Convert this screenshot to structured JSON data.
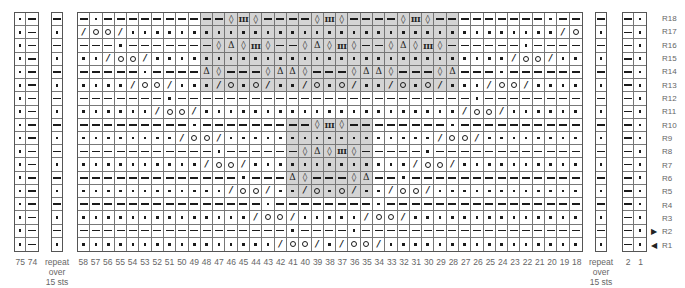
{
  "legend_symbols": {
    "-": "purl",
    ".": "knit",
    "/": "k2tog",
    "o": "yarn-over",
    "d": "diamond",
    "t": "triangle",
    "3": "triple-bar"
  },
  "symbol_glyphs": {
    "/": "/",
    "d": "◊",
    "t": "Δ",
    "3": "III"
  },
  "left_panel": {
    "columns": [
      "75",
      "74"
    ],
    "rows_pattern": [
      ".-"
    ]
  },
  "left_repeat": {
    "label_lines": [
      "repeat",
      "over",
      "15 sts"
    ]
  },
  "right_repeat": {
    "label_lines": [
      "repeat",
      "over",
      "15 sts"
    ]
  },
  "right_panel": {
    "columns": [
      "2",
      "1"
    ],
    "rows_pattern": [
      "-."
    ]
  },
  "main_chart": {
    "columns": [
      "58",
      "57",
      "56",
      "55",
      "54",
      "53",
      "52",
      "51",
      "50",
      "49",
      "48",
      "47",
      "46",
      "45",
      "44",
      "43",
      "42",
      "41",
      "40",
      "39",
      "38",
      "37",
      "36",
      "35",
      "34",
      "33",
      "32",
      "31",
      "30",
      "29",
      "28",
      "27",
      "26",
      "25",
      "24",
      "23",
      "22",
      "21",
      "20",
      "19",
      "18"
    ],
    "rows": [
      {
        "label": "R18",
        "cells": "-.----------d3d----d3d----d3d---------.--",
        "repeat": "-"
      },
      {
        "label": "R17",
        "cells": "/oo/.................................../oo/",
        "repeat": "."
      },
      {
        "label": "R16",
        "cells": "---.-------dtd3d--dtd3d--dtd3d------.----",
        "repeat": "-"
      },
      {
        "label": "R15",
        "cells": "../oo/............................./oo/..",
        "repeat": "."
      },
      {
        "label": "R14",
        "cells": "-----.----td---dttd---dttd---dt---.------",
        "repeat": "-"
      },
      {
        "label": "R13",
        "cells": "..../oo/.../o.o/../o.o/../o.o/.../oo/....",
        "repeat": "."
      },
      {
        "label": "R12",
        "cells": "-------.------------------------.--------",
        "repeat": "-"
      },
      {
        "label": "R11",
        "cells": "....../oo/...................../oo/......",
        "repeat": "."
      },
      {
        "label": "R10",
        "cells": "---------.---------d3d--------.----------",
        "repeat": "-"
      },
      {
        "label": "R9",
        "cells": "......../oo/................./oo/........",
        "repeat": "."
      },
      {
        "label": "R8",
        "cells": "-----------.------dtd3d-----.------------",
        "repeat": "-"
      },
      {
        "label": "R7",
        "cells": "........../oo/............./oo/..........",
        "repeat": "."
      },
      {
        "label": "R6",
        "cells": "-------------.---td---dt--.--------------",
        "repeat": "-"
      },
      {
        "label": "R5",
        "cells": "............/oo/../o.o/../oo/............",
        "repeat": "."
      },
      {
        "label": "R4",
        "cells": "---------------.--------.----------------",
        "repeat": "-"
      },
      {
        "label": "R3",
        "cells": "............../oo/...../oo/..............",
        "repeat": "."
      },
      {
        "label": "R2",
        "cells": "-----------------.----.------------------",
        "repeat": "-"
      },
      {
        "label": "R1",
        "cells": "................/oo/./oo/................",
        "repeat": "."
      }
    ],
    "shaded_regions": [
      {
        "rows": [
          "R18",
          "R13"
        ],
        "cols": [
          "48",
          "28"
        ]
      },
      {
        "rows": [
          "R10",
          "R5"
        ],
        "cols": [
          "41",
          "35"
        ]
      }
    ]
  },
  "row_arrows": [
    {
      "row": "R2",
      "direction": "right",
      "glyph": "▶"
    },
    {
      "row": "R1",
      "direction": "left",
      "glyph": "◀"
    }
  ],
  "colors": {
    "shade": "#d4d4d4",
    "grid_line": "#777777",
    "symbol": "#1a1a1a",
    "label": "#666666"
  }
}
